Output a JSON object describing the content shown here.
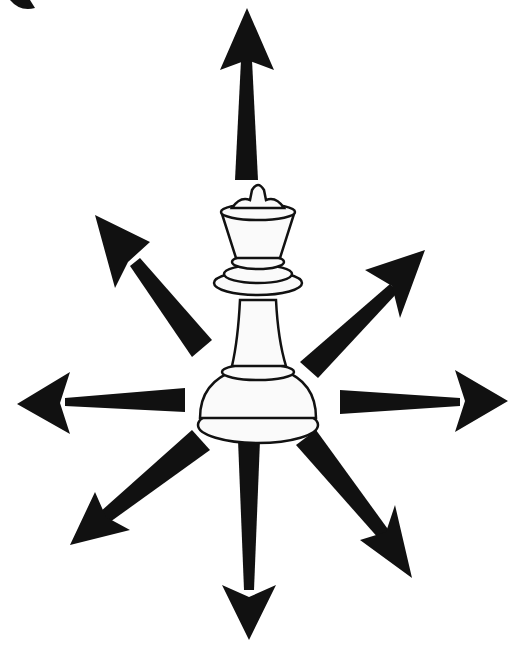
{
  "diagram": {
    "piece": "queen",
    "arrow_color": "#111111",
    "piece_fill": "#fafafa",
    "piece_stroke": "#111111",
    "directions": [
      "north",
      "northeast",
      "east",
      "southeast",
      "south",
      "southwest",
      "west",
      "northwest"
    ]
  }
}
